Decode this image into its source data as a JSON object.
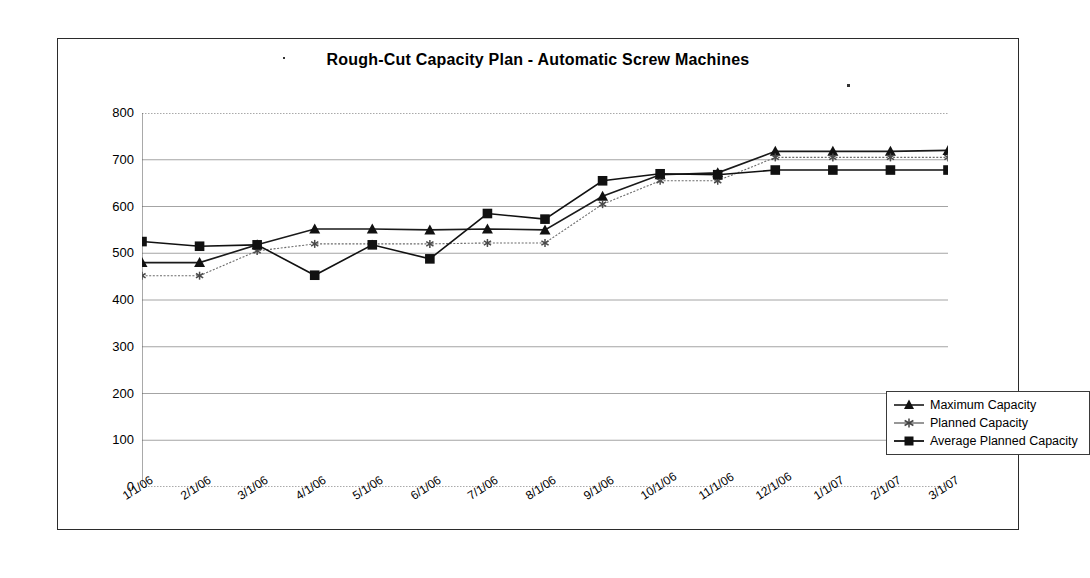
{
  "chart_data": {
    "type": "line",
    "title": "Rough-Cut Capacity Plan - Automatic Screw Machines",
    "xlabel": "",
    "ylabel": "",
    "ylim": [
      0,
      800
    ],
    "ytick_step": 100,
    "yticks": [
      "800",
      "700",
      "600",
      "500",
      "400",
      "300",
      "200",
      "100",
      "0"
    ],
    "grid": true,
    "legend_position": "right-inside-lower",
    "categories": [
      "1/1/06",
      "2/1/06",
      "3/1/06",
      "4/1/06",
      "5/1/06",
      "6/1/06",
      "7/1/06",
      "8/1/06",
      "9/1/06",
      "10/1/06",
      "11/1/06",
      "12/1/06",
      "1/1/07",
      "2/1/07",
      "3/1/07"
    ],
    "series": [
      {
        "name": "Maximum Capacity",
        "marker": "triangle",
        "color": "#1a1a1a",
        "values": [
          480,
          480,
          518,
          552,
          552,
          550,
          552,
          550,
          622,
          668,
          672,
          718,
          718,
          718,
          720
        ]
      },
      {
        "name": "Planned Capacity",
        "marker": "asterisk",
        "color": "#6b6b6b",
        "values": [
          452,
          452,
          505,
          520,
          520,
          520,
          522,
          522,
          605,
          655,
          655,
          705,
          705,
          705,
          705
        ]
      },
      {
        "name": "Average Planned Capacity",
        "marker": "square",
        "color": "#111111",
        "values": [
          525,
          515,
          518,
          453,
          518,
          488,
          585,
          573,
          655,
          670,
          668,
          678,
          678,
          678,
          678
        ]
      }
    ]
  },
  "legend": {
    "items": [
      {
        "label": "Maximum Capacity",
        "marker": "triangle"
      },
      {
        "label": "Planned Capacity",
        "marker": "asterisk"
      },
      {
        "label": "Average Planned Capacity",
        "marker": "square"
      }
    ]
  }
}
